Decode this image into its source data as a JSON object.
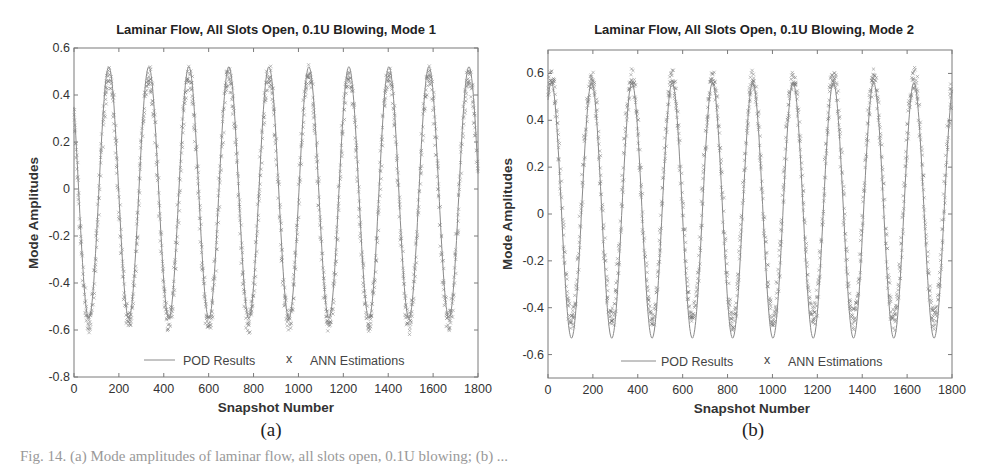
{
  "figure": {
    "caption_fragment": "Fig. 14. (a) Mode amplitudes of laminar flow, all slots open, 0.1U blowing; (b) ..."
  },
  "panels": [
    {
      "id": "a",
      "sublabel": "(a)",
      "title": "Laminar Flow, All Slots Open, 0.1U Blowing, Mode 1",
      "xlabel": "Snapshot Number",
      "ylabel": "Mode Amplitudes",
      "xticks": [
        "0",
        "200",
        "400",
        "600",
        "800",
        "1000",
        "1200",
        "1400",
        "1600",
        "1800"
      ],
      "yticks": [
        "0.6",
        "0.4",
        "0.2",
        "0",
        "-0.2",
        "-0.4",
        "-0.6",
        "-0.8"
      ],
      "legend": {
        "line_label": "POD Results",
        "marker_label": "ANN Estimations"
      }
    },
    {
      "id": "b",
      "sublabel": "(b)",
      "title": "Laminar Flow, All Slots Open, 0.1U Blowing, Mode 2",
      "xlabel": "Snapshot Number",
      "ylabel": "Mode Amplitudes",
      "xticks": [
        "0",
        "200",
        "400",
        "600",
        "800",
        "1000",
        "1200",
        "1400",
        "1600",
        "1800"
      ],
      "yticks": [
        "0.6",
        "0.4",
        "0.2",
        "0",
        "-0.2",
        "-0.4",
        "-0.6"
      ],
      "legend": {
        "line_label": "POD Results",
        "marker_label": "ANN Estimations"
      }
    }
  ],
  "colors": {
    "pod_line": "#8a8a8a",
    "ann_marker": "#6f6f6f",
    "axis": "#7a7a7a",
    "text": "#222222"
  },
  "chart_data": [
    {
      "type": "line",
      "title": "Laminar Flow, All Slots Open, 0.1U Blowing, Mode 1",
      "xlabel": "Snapshot Number",
      "ylabel": "Mode Amplitudes",
      "xlim": [
        0,
        1800
      ],
      "ylim": [
        -0.8,
        0.6
      ],
      "grid": false,
      "legend_position": "bottom-inside",
      "legend": [
        "POD Results",
        "ANN Estimations"
      ],
      "model": {
        "pod_amplitude_max": 0.52,
        "pod_amplitude_min": -0.55,
        "period": 178.3,
        "first_peak": 155,
        "ann_peak": 0.48,
        "ann_trough": -0.57
      },
      "series": [
        {
          "name": "POD Results",
          "style": "line",
          "x": [
            0,
            65,
            155,
            244,
            333,
            422,
            511,
            600,
            690,
            779,
            868,
            957,
            1046,
            1135,
            1225,
            1314,
            1403,
            1492,
            1580,
            1670,
            1760,
            1800
          ],
          "y": [
            0.23,
            -0.55,
            0.52,
            -0.55,
            0.52,
            -0.55,
            0.52,
            -0.55,
            0.52,
            -0.55,
            0.52,
            -0.55,
            0.52,
            -0.55,
            0.52,
            -0.55,
            0.52,
            -0.55,
            0.52,
            -0.55,
            0.52,
            0.05
          ]
        },
        {
          "name": "ANN Estimations",
          "style": "markers-x",
          "x": [
            0,
            65,
            155,
            244,
            333,
            422,
            511,
            600,
            690,
            779,
            868,
            957,
            1046,
            1135,
            1225,
            1314,
            1403,
            1492,
            1580,
            1670,
            1760,
            1800
          ],
          "y": [
            0.22,
            -0.57,
            0.48,
            -0.57,
            0.48,
            -0.57,
            0.48,
            -0.57,
            0.48,
            -0.57,
            0.48,
            -0.57,
            0.48,
            -0.57,
            0.48,
            -0.57,
            0.48,
            -0.57,
            0.48,
            -0.57,
            0.48,
            0.04
          ]
        }
      ]
    },
    {
      "type": "line",
      "title": "Laminar Flow, All Slots Open, 0.1U Blowing, Mode 2",
      "xlabel": "Snapshot Number",
      "ylabel": "Mode Amplitudes",
      "xlim": [
        0,
        1800
      ],
      "ylim": [
        -0.7,
        0.7
      ],
      "grid": false,
      "legend_position": "bottom-inside",
      "legend": [
        "POD Results",
        "ANN Estimations"
      ],
      "model": {
        "pod_amplitude_max": 0.56,
        "pod_amplitude_min": -0.53,
        "period": 179.5,
        "first_peak": 15,
        "ann_peak": 0.58,
        "ann_trough": -0.45
      },
      "series": [
        {
          "name": "POD Results",
          "style": "line",
          "x": [
            0,
            15,
            105,
            195,
            285,
            375,
            465,
            555,
            645,
            735,
            820,
            915,
            1000,
            1090,
            1180,
            1265,
            1360,
            1445,
            1540,
            1625,
            1720,
            1800
          ],
          "y": [
            0.55,
            0.56,
            -0.53,
            0.56,
            -0.53,
            0.56,
            -0.53,
            0.56,
            -0.53,
            0.56,
            -0.53,
            0.56,
            -0.53,
            0.56,
            -0.53,
            0.56,
            -0.53,
            0.56,
            -0.53,
            0.56,
            -0.53,
            0.55
          ]
        },
        {
          "name": "ANN Estimations",
          "style": "markers-x",
          "x": [
            0,
            15,
            105,
            195,
            285,
            375,
            465,
            555,
            645,
            735,
            820,
            915,
            1000,
            1090,
            1180,
            1265,
            1360,
            1445,
            1540,
            1625,
            1720,
            1800
          ],
          "y": [
            0.56,
            0.58,
            -0.45,
            0.57,
            -0.44,
            0.58,
            -0.46,
            0.58,
            -0.45,
            0.57,
            -0.45,
            0.6,
            -0.44,
            0.55,
            -0.45,
            0.58,
            -0.46,
            0.58,
            -0.45,
            0.57,
            -0.45,
            0.55
          ]
        }
      ]
    }
  ]
}
